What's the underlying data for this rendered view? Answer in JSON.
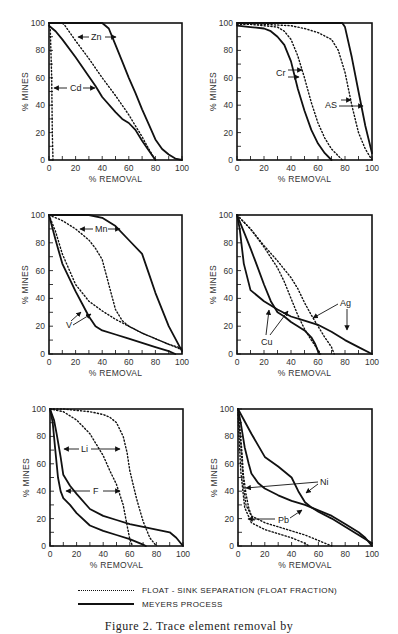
{
  "legend": {
    "dotted_label": "FLOAT - SINK SEPARATION (FLOAT FRACTION)",
    "solid_label": "MEYERS PROCESS"
  },
  "caption": "Figure 2. Trace element removal by",
  "axis": {
    "xlabel": "% REMOVAL",
    "ylabel": "% MINES",
    "ticks": [
      "0",
      "20",
      "40",
      "60",
      "80",
      "100"
    ]
  },
  "chart_data": [
    {
      "type": "line",
      "panel": "top-left",
      "title": "",
      "xlabel": "% REMOVAL",
      "ylabel": "% MINES",
      "xlim": [
        0,
        100
      ],
      "ylim": [
        0,
        100
      ],
      "grid": false,
      "annotations": [
        "Zn",
        "Cd"
      ],
      "series": [
        {
          "name": "Zn - Meyers Process",
          "style": "solid",
          "x": [
            0,
            10,
            20,
            30,
            40,
            45,
            50,
            55,
            60,
            65,
            70,
            75,
            80,
            85,
            90,
            95,
            100
          ],
          "y": [
            100,
            100,
            100,
            100,
            100,
            96,
            84,
            72,
            60,
            49,
            37,
            26,
            15,
            8,
            4,
            1,
            0
          ]
        },
        {
          "name": "Zn - Float-Sink",
          "style": "dotted",
          "x": [
            0,
            10,
            12,
            20,
            30,
            40,
            50,
            60,
            65,
            70,
            75,
            80
          ],
          "y": [
            100,
            100,
            98,
            87,
            74,
            60,
            47,
            33,
            25,
            17,
            8,
            0
          ]
        },
        {
          "name": "Cd - Meyers Process",
          "style": "solid",
          "x": [
            0,
            5,
            10,
            20,
            30,
            35,
            40,
            50,
            55,
            60,
            65,
            70,
            75,
            80
          ],
          "y": [
            98,
            94,
            88,
            75,
            61,
            54,
            46,
            35,
            30,
            27,
            22,
            14,
            7,
            0
          ]
        },
        {
          "name": "Cd - Float-Sink",
          "style": "dotted",
          "x": [
            0,
            1,
            2,
            2.5,
            3
          ],
          "y": [
            100,
            95,
            60,
            20,
            0
          ]
        }
      ]
    },
    {
      "type": "line",
      "panel": "top-right",
      "title": "",
      "xlabel": "% REMOVAL",
      "ylabel": "% MINES",
      "xlim": [
        0,
        100
      ],
      "ylim": [
        0,
        100
      ],
      "grid": false,
      "annotations": [
        "Cr",
        "AS"
      ],
      "series": [
        {
          "name": "Cr - Meyers Process",
          "style": "solid",
          "x": [
            0,
            10,
            20,
            25,
            30,
            35,
            40,
            45,
            50,
            55,
            60,
            65,
            70
          ],
          "y": [
            98,
            97,
            96,
            94,
            90,
            84,
            72,
            52,
            36,
            22,
            12,
            5,
            0
          ]
        },
        {
          "name": "Cr - Float-Sink",
          "style": "dotted",
          "x": [
            0,
            10,
            20,
            30,
            35,
            40,
            45,
            50,
            55,
            60,
            65,
            70,
            75,
            78
          ],
          "y": [
            99,
            99,
            98,
            97,
            94,
            88,
            76,
            60,
            42,
            27,
            16,
            8,
            3,
            0
          ]
        },
        {
          "name": "As - Meyers Process",
          "style": "solid",
          "x": [
            0,
            60,
            70,
            78,
            80,
            85,
            90,
            95,
            100
          ],
          "y": [
            100,
            100,
            100,
            100,
            97,
            75,
            50,
            25,
            5
          ]
        },
        {
          "name": "As - Float-Sink",
          "style": "dotted",
          "x": [
            0,
            20,
            40,
            50,
            60,
            70,
            75,
            80,
            85,
            90,
            95,
            100
          ],
          "y": [
            100,
            99,
            98,
            96,
            93,
            88,
            80,
            64,
            40,
            20,
            8,
            0
          ]
        }
      ]
    },
    {
      "type": "line",
      "panel": "middle-left",
      "title": "",
      "xlabel": "% REMOVAL",
      "ylabel": "% MINES",
      "xlim": [
        0,
        100
      ],
      "ylim": [
        0,
        100
      ],
      "grid": false,
      "annotations": [
        "Mn",
        "V"
      ],
      "series": [
        {
          "name": "Mn - Meyers Process",
          "style": "solid",
          "x": [
            0,
            10,
            20,
            30,
            40,
            50,
            60,
            70,
            75,
            80,
            90,
            100
          ],
          "y": [
            100,
            100,
            100,
            100,
            98,
            92,
            82,
            72,
            58,
            44,
            20,
            2
          ]
        },
        {
          "name": "Mn - Float-Sink",
          "style": "dotted",
          "x": [
            0,
            10,
            20,
            30,
            35,
            40,
            45,
            50,
            55,
            60,
            70,
            80,
            90,
            100
          ],
          "y": [
            100,
            96,
            90,
            82,
            76,
            68,
            50,
            32,
            24,
            20,
            15,
            11,
            7,
            4
          ]
        },
        {
          "name": "V - Meyers Process",
          "style": "solid",
          "x": [
            0,
            5,
            10,
            15,
            20,
            25,
            30,
            35,
            40,
            50,
            60,
            70,
            80,
            90,
            95
          ],
          "y": [
            100,
            82,
            65,
            55,
            45,
            36,
            27,
            20,
            17,
            14,
            11,
            8,
            5,
            2,
            0
          ]
        },
        {
          "name": "V - Float-Sink",
          "style": "dotted",
          "x": [
            0,
            5,
            10,
            20,
            30,
            40,
            50,
            60,
            70,
            80,
            90,
            100
          ],
          "y": [
            100,
            88,
            72,
            50,
            38,
            31,
            25,
            20,
            15,
            11,
            7,
            3
          ]
        }
      ]
    },
    {
      "type": "line",
      "panel": "middle-right",
      "title": "",
      "xlabel": "% REMOVAL",
      "ylabel": "% MINES",
      "xlim": [
        0,
        100
      ],
      "ylim": [
        0,
        100
      ],
      "grid": false,
      "annotations": [
        "Ag",
        "Cu"
      ],
      "series": [
        {
          "name": "Ag - Meyers Process",
          "style": "solid",
          "x": [
            0,
            2,
            5,
            10,
            20,
            30,
            40,
            50,
            60,
            70,
            80,
            90,
            100
          ],
          "y": [
            100,
            90,
            65,
            46,
            38,
            32,
            27,
            24,
            21,
            16,
            10,
            5,
            0
          ]
        },
        {
          "name": "Ag - Float-Sink",
          "style": "dotted",
          "x": [
            0,
            10,
            20,
            30,
            40,
            45,
            50,
            55,
            60,
            65,
            70,
            72
          ],
          "y": [
            100,
            90,
            78,
            67,
            55,
            47,
            37,
            28,
            20,
            12,
            5,
            0
          ]
        },
        {
          "name": "Cu - Meyers Process",
          "style": "solid",
          "x": [
            0,
            5,
            10,
            15,
            20,
            25,
            30,
            35,
            40,
            45,
            50,
            55,
            58,
            60,
            61
          ],
          "y": [
            100,
            88,
            76,
            63,
            50,
            38,
            30,
            27,
            23,
            20,
            17,
            12,
            7,
            2,
            0
          ]
        },
        {
          "name": "Cu - Float-Sink",
          "style": "dotted",
          "x": [
            0,
            10,
            20,
            30,
            35,
            40,
            45,
            50,
            55,
            60,
            62
          ],
          "y": [
            100,
            90,
            77,
            62,
            52,
            40,
            28,
            18,
            10,
            3,
            0
          ]
        }
      ]
    },
    {
      "type": "line",
      "panel": "bottom-left",
      "title": "",
      "xlabel": "% REMOVAL",
      "ylabel": "% MINES",
      "xlim": [
        0,
        100
      ],
      "ylim": [
        0,
        100
      ],
      "grid": false,
      "annotations": [
        "Li",
        "F"
      ],
      "series": [
        {
          "name": "Li - Meyers Process",
          "style": "solid",
          "x": [
            0,
            3,
            5,
            8,
            10,
            15,
            20,
            30,
            40,
            50,
            60,
            70,
            80,
            90,
            95,
            100
          ],
          "y": [
            100,
            92,
            82,
            65,
            52,
            44,
            38,
            27,
            22,
            19,
            16,
            14,
            12,
            10,
            6,
            0
          ]
        },
        {
          "name": "Li - Float-Sink",
          "style": "dotted",
          "x": [
            0,
            10,
            20,
            30,
            40,
            45,
            50,
            55,
            58,
            60,
            65,
            70,
            75,
            80
          ],
          "y": [
            100,
            100,
            99,
            98,
            96,
            94,
            90,
            80,
            68,
            55,
            35,
            18,
            6,
            0
          ]
        },
        {
          "name": "F - Meyers Process",
          "style": "solid",
          "x": [
            0,
            2,
            4,
            6,
            8,
            10,
            15,
            20,
            30,
            40,
            50,
            60,
            70,
            72
          ],
          "y": [
            100,
            90,
            70,
            50,
            40,
            35,
            30,
            24,
            15,
            11,
            8,
            5,
            1,
            0
          ]
        },
        {
          "name": "F - Float-Sink",
          "style": "dotted",
          "x": [
            0,
            10,
            20,
            30,
            40,
            45,
            50,
            55,
            58,
            60,
            62
          ],
          "y": [
            100,
            98,
            92,
            82,
            66,
            55,
            45,
            30,
            15,
            5,
            0
          ]
        }
      ]
    },
    {
      "type": "line",
      "panel": "bottom-right",
      "title": "",
      "xlabel": "% REMOVAL",
      "ylabel": "% MINES",
      "xlim": [
        0,
        100
      ],
      "ylim": [
        0,
        100
      ],
      "grid": false,
      "annotations": [
        "Ni",
        "Pb"
      ],
      "series": [
        {
          "name": "Ni - Meyers Process",
          "style": "solid",
          "x": [
            0,
            10,
            20,
            30,
            40,
            45,
            50,
            55,
            60,
            70,
            80,
            90,
            100
          ],
          "y": [
            100,
            82,
            65,
            58,
            50,
            40,
            32,
            28,
            25,
            20,
            14,
            8,
            2
          ]
        },
        {
          "name": "Ni - Float-Sink",
          "style": "dotted",
          "x": [
            0,
            1,
            2,
            3,
            4,
            6,
            8,
            10,
            12
          ],
          "y": [
            100,
            90,
            80,
            68,
            52,
            38,
            28,
            22,
            19
          ]
        },
        {
          "name": "Pb - Meyers Process",
          "style": "solid",
          "x": [
            0,
            2,
            5,
            8,
            10,
            15,
            20,
            30,
            40,
            50,
            55,
            60,
            70,
            80,
            90,
            95,
            100
          ],
          "y": [
            100,
            90,
            72,
            60,
            53,
            46,
            42,
            37,
            33,
            30,
            28,
            26,
            22,
            16,
            10,
            6,
            0
          ]
        },
        {
          "name": "Pb - Float-Sink",
          "style": "dotted",
          "x": [
            0,
            2,
            4,
            6,
            10,
            20,
            30,
            40,
            50,
            60,
            70
          ],
          "y": [
            100,
            75,
            45,
            30,
            22,
            17,
            14,
            11,
            8,
            4,
            0
          ]
        },
        {
          "name": "Pb - Float-Sink (lower)",
          "style": "dotted",
          "x": [
            0,
            2,
            5,
            10,
            20,
            30,
            40,
            50,
            53
          ],
          "y": [
            96,
            55,
            28,
            17,
            12,
            9,
            6,
            2,
            0
          ]
        }
      ]
    }
  ],
  "labels": {
    "zn": "Zn",
    "cd": "Cd",
    "cr": "Cr",
    "as": "AS",
    "mn": "Mn",
    "v": "V",
    "ag": "Ag",
    "cu": "Cu",
    "li": "Li",
    "f": "F",
    "ni": "Ni",
    "pb": "Pb"
  }
}
